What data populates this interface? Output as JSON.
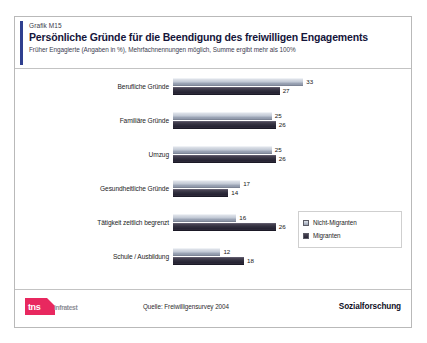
{
  "header": {
    "grafik_no": "Grafik M15",
    "title": "Persönliche Gründe für die Beendigung des freiwilligen Engagements",
    "subtitle": "Früher Engagierte (Angaben in %), Mehrfachnennungen möglich, Summe ergibt mehr als 100%"
  },
  "footer": {
    "logo_primary": "tns",
    "logo_secondary": "infratest",
    "source": "Quelle: Freiwilligensurvey 2004",
    "brand": "Sozialforschung"
  },
  "legend": {
    "items": [
      {
        "label": "Nicht-Migranten",
        "swatch": "light"
      },
      {
        "label": "Migranten",
        "swatch": "dark"
      }
    ]
  },
  "chart_data": {
    "type": "bar",
    "orientation": "horizontal",
    "title": "Persönliche Gründe für die Beendigung des freiwilligen Engagements",
    "subtitle": "Früher Engagierte (Angaben in %), Mehrfachnennungen möglich, Summe ergibt mehr als 100%",
    "xlabel": "",
    "ylabel": "",
    "unit": "%",
    "xlim": [
      0,
      35
    ],
    "grid": false,
    "legend_position": "right",
    "categories": [
      "Berufliche Gründe",
      "Familiäre Gründe",
      "Umzug",
      "Gesundheitliche Gründe",
      "Tätigkeit zeitlich begrenzt",
      "Schule / Ausbildung"
    ],
    "series": [
      {
        "name": "Nicht-Migranten",
        "color": "#c3cad6",
        "values": [
          33,
          25,
          25,
          17,
          16,
          12
        ]
      },
      {
        "name": "Migranten",
        "color": "#2e2b3a",
        "values": [
          27,
          26,
          26,
          14,
          26,
          18
        ]
      }
    ]
  },
  "colors": {
    "accent": "#2f3f8f",
    "logo_red": "#e8285f",
    "bar_light": "#c3cad6",
    "bar_dark": "#2e2b3a"
  }
}
